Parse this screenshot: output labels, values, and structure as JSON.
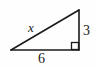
{
  "figure": {
    "kind": "right-triangle-diagram",
    "background_color": "#fefefe",
    "stroke_color": "#1a1a1a",
    "label_color": "#1a1a1a"
  },
  "labels": {
    "hypotenuse": "x",
    "vertical_leg": "3",
    "horizontal_leg": "6"
  },
  "geometry": {
    "left_vertex": "11,50",
    "bottom_right_vertex": "79,50",
    "apex_vertex": "79,10",
    "right_angle_marker": "right-angle-square"
  }
}
